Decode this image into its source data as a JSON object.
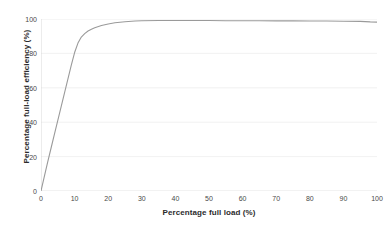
{
  "chart_data": {
    "type": "line",
    "title": "",
    "xlabel": "Percentage full load (%)",
    "ylabel": "Percentage full-load efficiency (%)",
    "xlim": [
      0,
      100
    ],
    "ylim": [
      0,
      100
    ],
    "xticks": [
      0,
      10,
      20,
      30,
      40,
      50,
      60,
      70,
      80,
      90,
      100
    ],
    "yticks": [
      0,
      20,
      40,
      60,
      80,
      100
    ],
    "grid": "horizontal",
    "legend": "none",
    "line_color": "#9a9a9a",
    "series": [
      {
        "name": "Efficiency",
        "x": [
          0,
          1,
          2,
          3,
          4,
          5,
          6,
          7,
          8,
          9,
          10,
          11,
          12,
          13,
          14,
          15,
          16,
          18,
          20,
          22,
          25,
          28,
          30,
          35,
          40,
          45,
          50,
          55,
          60,
          65,
          70,
          75,
          80,
          85,
          90,
          95,
          98,
          100
        ],
        "values": [
          0,
          8.5,
          17,
          25,
          33,
          41,
          49,
          57,
          65,
          73,
          80.5,
          86,
          89.5,
          91.5,
          93,
          94,
          94.9,
          96.2,
          97.1,
          97.8,
          98.4,
          98.8,
          99.0,
          99.1,
          99.1,
          99.1,
          99.1,
          99.0,
          99.0,
          99.0,
          98.9,
          98.9,
          98.8,
          98.8,
          98.7,
          98.6,
          98.3,
          98.2
        ]
      }
    ]
  },
  "axes": {
    "x_tick_labels": [
      "0",
      "10",
      "20",
      "30",
      "40",
      "50",
      "60",
      "70",
      "80",
      "90",
      "100"
    ],
    "y_tick_labels": [
      "0",
      "20",
      "40",
      "60",
      "80",
      "100"
    ],
    "x_title": "Percentage full load (%)",
    "y_title": "Percentage full-load efficiency (%)"
  },
  "colors": {
    "line": "#9a9a9a",
    "grid": "#ececec",
    "axis": "#d8d8d8",
    "text": "#4a4a4a",
    "background": "#ffffff"
  }
}
